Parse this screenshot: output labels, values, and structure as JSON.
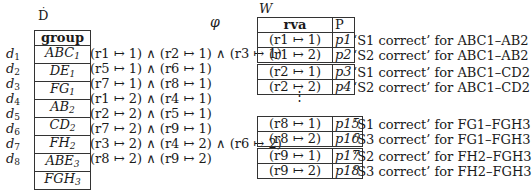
{
  "left": {
    "title": "D",
    "column_header": "group",
    "phi_header": "φ",
    "rows": [
      {
        "label": "d",
        "idx": "1",
        "group": "ABC",
        "gsub": "1",
        "formula": "(r1 ↦ 1) ∧ (r2 ↦ 1) ∧ (r3 ↦ 1)"
      },
      {
        "label": "d",
        "idx": "2",
        "group": "DE",
        "gsub": "1",
        "formula": "(r5 ↦ 1) ∧ (r6 ↦ 1)"
      },
      {
        "label": "d",
        "idx": "3",
        "group": "FG",
        "gsub": "1",
        "formula": "(r7 ↦ 1) ∧ (r8 ↦ 1)"
      },
      {
        "label": "d",
        "idx": "4",
        "group": "AB",
        "gsub": "2",
        "formula": "(r1 ↦ 2) ∧ (r4 ↦ 1)"
      },
      {
        "label": "d",
        "idx": "5",
        "group": "CD",
        "gsub": "2",
        "formula": "(r2 ↦ 2) ∧ (r5 ↦ 1)"
      },
      {
        "label": "d",
        "idx": "6",
        "group": "FH",
        "gsub": "2",
        "formula": "(r7 ↦ 2) ∧ (r9 ↦ 1)"
      },
      {
        "label": "d",
        "idx": "7",
        "group": "ABE",
        "gsub": "3",
        "formula": "(r3 ↦ 2) ∧ (r4 ↦ 2) ∧ (r6 ↦ 2)"
      },
      {
        "label": "d",
        "idx": "8",
        "group": "FGH",
        "gsub": "3",
        "formula": "(r8 ↦ 2) ∧ (r9 ↦ 2)"
      }
    ]
  },
  "right": {
    "title": "W",
    "headers": {
      "rva": "rva",
      "p": "P"
    },
    "rows": [
      {
        "rva": "(r1 ↦ 1)",
        "p": "p1",
        "desc": "‘S1 correct’ for ABC1–AB2"
      },
      {
        "rva": "(r1 ↦ 2)",
        "p": "p2",
        "desc": "‘S2 correct’ for ABC1–AB2"
      },
      {
        "rva": "(r2 ↦ 1)",
        "p": "p3",
        "desc": "‘S1 correct’ for ABC1–CD2"
      },
      {
        "rva": "(r2 ↦ 2)",
        "p": "p4",
        "desc": "‘S2 correct’ for ABC1–CD2"
      },
      {
        "rva": "(r8 ↦ 1)",
        "p": "p15",
        "desc": "‘S1 correct’ for FG1–FGH3"
      },
      {
        "rva": "(r8 ↦ 2)",
        "p": "p16",
        "desc": "‘S3 correct’ for FG1–FGH3"
      },
      {
        "rva": "(r9 ↦ 1)",
        "p": "p17",
        "desc": "‘S2 correct’ for FH2–FGH3"
      },
      {
        "rva": "(r9 ↦ 2)",
        "p": "p18",
        "desc": "‘S3 correct’ for FH2–FGH3"
      }
    ],
    "ellipsis": "⋮"
  }
}
